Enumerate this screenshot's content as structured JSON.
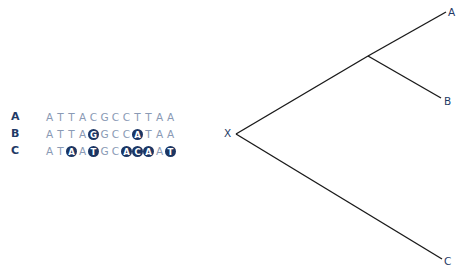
{
  "sequences": {
    "rows": [
      {
        "label": "A",
        "bases": [
          {
            "b": "A",
            "m": false
          },
          {
            "b": "T",
            "m": false
          },
          {
            "b": "T",
            "m": false
          },
          {
            "b": "A",
            "m": false
          },
          {
            "b": "C",
            "m": false
          },
          {
            "b": "G",
            "m": false
          },
          {
            "b": "C",
            "m": false
          },
          {
            "b": "C",
            "m": false
          },
          {
            "b": "T",
            "m": false
          },
          {
            "b": "T",
            "m": false
          },
          {
            "b": "A",
            "m": false
          },
          {
            "b": "A",
            "m": false
          }
        ]
      },
      {
        "label": "B",
        "bases": [
          {
            "b": "A",
            "m": false
          },
          {
            "b": "T",
            "m": false
          },
          {
            "b": "T",
            "m": false
          },
          {
            "b": "A",
            "m": false
          },
          {
            "b": "G",
            "m": true
          },
          {
            "b": "G",
            "m": false
          },
          {
            "b": "C",
            "m": false
          },
          {
            "b": "C",
            "m": false
          },
          {
            "b": "A",
            "m": true
          },
          {
            "b": "T",
            "m": false
          },
          {
            "b": "A",
            "m": false
          },
          {
            "b": "A",
            "m": false
          }
        ]
      },
      {
        "label": "C",
        "bases": [
          {
            "b": "A",
            "m": false
          },
          {
            "b": "T",
            "m": false
          },
          {
            "b": "A",
            "m": true
          },
          {
            "b": "A",
            "m": false
          },
          {
            "b": "T",
            "m": true
          },
          {
            "b": "G",
            "m": false
          },
          {
            "b": "C",
            "m": false
          },
          {
            "b": "A",
            "m": true
          },
          {
            "b": "C",
            "m": true
          },
          {
            "b": "A",
            "m": true
          },
          {
            "b": "A",
            "m": false
          },
          {
            "b": "T",
            "m": true
          }
        ]
      }
    ]
  },
  "tree": {
    "root_label": "X",
    "leaves": [
      {
        "label": "A"
      },
      {
        "label": "B"
      },
      {
        "label": "C"
      }
    ]
  },
  "colors": {
    "label": "#1f3a66",
    "base": "#8a9ab5",
    "mutation_fill": "#1b3563",
    "line": "#1a1a1a"
  }
}
